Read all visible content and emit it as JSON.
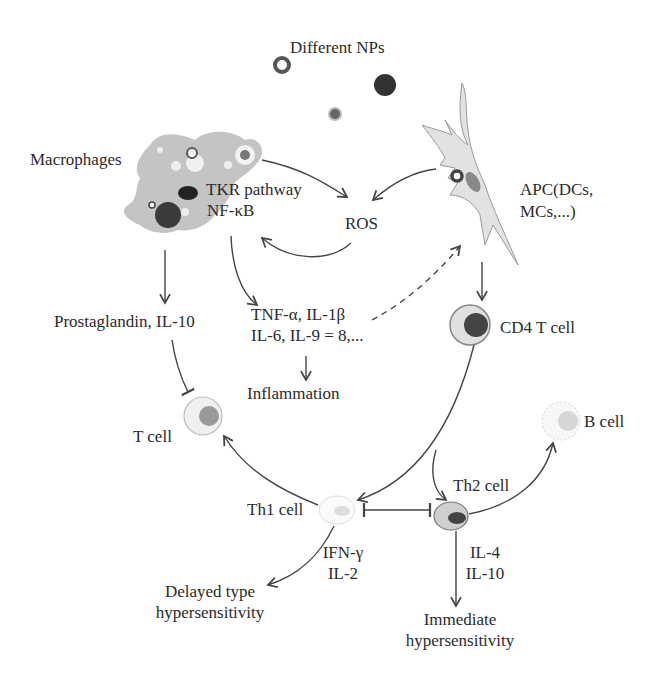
{
  "colors": {
    "line": "#444444",
    "cell_fill": "#cccccc",
    "cell_light": "#e6e6e6",
    "nucleus_dark": "#3a3a3a",
    "nucleus_mid": "#7a7a7a",
    "text": "#2b2b2b"
  },
  "nodes": {
    "nps": "Different NPs",
    "macrophages": "Macrophages",
    "tkr": "TKR pathway",
    "nfkb": "NF-κB",
    "ros": "ROS",
    "apc_line1": "APC(DCs,",
    "apc_line2": "MCs,...)",
    "prostaglandin": "Prostaglandin, IL-10",
    "cytokines_line1": "TNF-α, IL-1β",
    "cytokines_line2": "IL-6, IL-9 = 8,...",
    "inflammation": "Inflammation",
    "cd4": "CD4 T cell",
    "tcell": "T cell",
    "bcell": "B cell",
    "th2": "Th2 cell",
    "th1": "Th1 cell",
    "ifn_line1": "IFN-γ",
    "ifn_line2": "IL-2",
    "il4_line1": "IL-4",
    "il4_line2": "IL-10",
    "delayed_line1": "Delayed type",
    "delayed_line2": "hypersensitivity",
    "immediate_line1": "Immediate",
    "immediate_line2": "hypersensitivity"
  },
  "edges": [
    {
      "from": "macrophages",
      "to": "ros",
      "type": "arrow"
    },
    {
      "from": "apc",
      "to": "ros",
      "type": "arrow"
    },
    {
      "from": "ros",
      "to": "nfkb",
      "type": "arrow"
    },
    {
      "from": "macrophages",
      "to": "prostaglandin",
      "type": "arrow"
    },
    {
      "from": "nfkb",
      "to": "cytokines",
      "type": "arrow"
    },
    {
      "from": "cytokines",
      "to": "apc",
      "type": "dashed-arrow"
    },
    {
      "from": "cytokines",
      "to": "inflammation",
      "type": "arrow"
    },
    {
      "from": "apc",
      "to": "cd4",
      "type": "arrow"
    },
    {
      "from": "prostaglandin",
      "to": "tcell",
      "type": "inhibit"
    },
    {
      "from": "cd4",
      "to": "th1",
      "type": "arrow"
    },
    {
      "from": "cd4",
      "to": "th2",
      "type": "arrow"
    },
    {
      "from": "th1",
      "to": "tcell",
      "type": "arrow"
    },
    {
      "from": "th2",
      "to": "bcell",
      "type": "arrow"
    },
    {
      "from": "th1",
      "to": "th2",
      "type": "mutual-inhibit"
    },
    {
      "from": "th1",
      "to": "delayed",
      "type": "arrow"
    },
    {
      "from": "th2",
      "to": "immediate",
      "type": "arrow"
    }
  ]
}
